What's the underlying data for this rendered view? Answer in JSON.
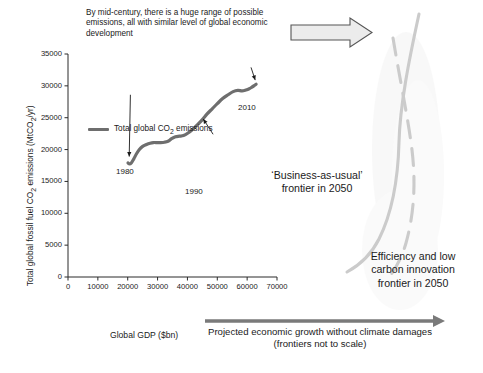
{
  "figure": {
    "top_caption": "By mid-century, there is a huge range of possible emissions, all with similar level of global economic development",
    "bottom_caption_line1": "Projected economic growth without climate damages",
    "bottom_caption_line2": "(frontiers not to scale)",
    "bau_label": "‘Business-as-usual’ frontier in 2050",
    "efficiency_label": "Efficiency and low carbon innovation frontier in 2050"
  },
  "colors": {
    "series_line": "#6e6e6e",
    "axis": "#2a2a2a",
    "frontier_curve": "#c9c9c9",
    "growth_arrow": "#7a7a7a",
    "block_arrow_fill": "#ececec",
    "block_arrow_stroke": "#555555",
    "text": "#1a1a1a"
  },
  "chart_data": {
    "type": "line",
    "title": "",
    "xlabel": "Global GDP ($bn)",
    "ylabel": "Total global fossil fuel CO2 emissions (MtCO2/yr)",
    "ylabel_rich": {
      "pre": "Total global fossil fuel CO",
      "sub1": "2",
      "mid": " emissions (MtCO",
      "sub2": "2",
      "post": "/yr)"
    },
    "xlim": [
      0,
      70000
    ],
    "ylim": [
      0,
      35000
    ],
    "xticks": [
      0,
      10000,
      20000,
      30000,
      40000,
      50000,
      60000,
      70000
    ],
    "yticks": [
      0,
      5000,
      10000,
      15000,
      20000,
      25000,
      30000,
      35000
    ],
    "xtick_labels": [
      "0",
      "10000",
      "20000",
      "30000",
      "40000",
      "50000",
      "60000",
      "70000"
    ],
    "ytick_labels": [
      "0",
      "5000",
      "10000",
      "15000",
      "20000",
      "25000",
      "30000",
      "35000"
    ],
    "grid": false,
    "legend": [
      {
        "label": "Total global CO2 emissions",
        "label_rich": {
          "pre": "Total global CO",
          "sub": "2",
          "post": " emissions"
        },
        "color": "#6e6e6e",
        "position": "inside-top-left"
      }
    ],
    "series": [
      {
        "name": "Total global CO2 emissions",
        "color": "#6e6e6e",
        "x": [
          20100,
          20600,
          21200,
          22000,
          22900,
          23900,
          25000,
          26300,
          27500,
          28600,
          29800,
          31000,
          32300,
          33500,
          34700,
          36000,
          37300,
          38700,
          40200,
          41800,
          43400,
          45000,
          46600,
          48300,
          50000,
          51800,
          53600,
          55300,
          56900,
          58300,
          59600,
          60700,
          61600,
          62400,
          63000
        ],
        "y": [
          17900,
          17750,
          17900,
          18500,
          19300,
          20000,
          20500,
          20800,
          21000,
          21100,
          21100,
          21100,
          21150,
          21300,
          21700,
          22000,
          22100,
          22200,
          22600,
          23200,
          23900,
          24700,
          25600,
          26400,
          27200,
          28000,
          28600,
          29100,
          29300,
          29200,
          29350,
          29550,
          29800,
          30050,
          30250
        ]
      }
    ],
    "annotations": [
      {
        "text": "1980",
        "point_x": 20600,
        "point_y": 17750,
        "label_x": 20800,
        "label_y": 29600
      },
      {
        "text": "1990",
        "point_x": 45500,
        "point_y": 25000,
        "label_x": 47500,
        "label_y": 21500
      },
      {
        "text": "2010",
        "point_x": 62900,
        "point_y": 30250,
        "label_x": 60500,
        "label_y": 33500
      }
    ]
  },
  "graphics": {
    "block_arrow": {
      "name": "right-block-arrow",
      "direction": "right"
    },
    "growth_arrow": {
      "name": "growth-arrow",
      "direction": "right"
    },
    "frontier_solid": {
      "name": "business-as-usual-frontier-curve",
      "style": "solid"
    },
    "frontier_dashed": {
      "name": "efficiency-frontier-curve",
      "style": "dashed"
    }
  }
}
